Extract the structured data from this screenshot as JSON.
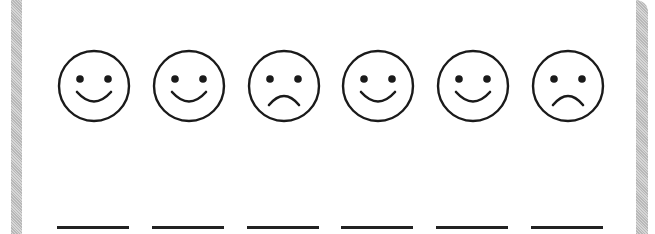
{
  "worksheet": {
    "faces": [
      {
        "type": "happy"
      },
      {
        "type": "happy"
      },
      {
        "type": "sad"
      },
      {
        "type": "happy"
      },
      {
        "type": "happy"
      },
      {
        "type": "sad"
      }
    ],
    "answer_blanks": 6
  },
  "colors": {
    "ink": "#1a1a1a",
    "frame": "#c4c4c4",
    "background": "#ffffff"
  }
}
